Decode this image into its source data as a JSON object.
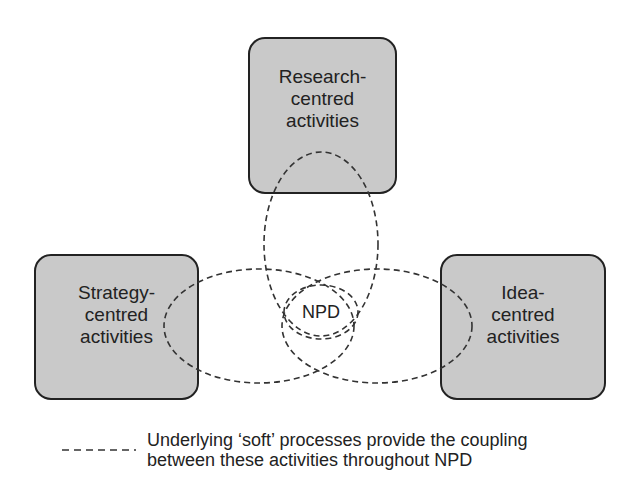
{
  "diagram": {
    "boxes": [
      {
        "id": "research",
        "label": "Research-\ncentred\nactivities"
      },
      {
        "id": "strategy",
        "label": "Strategy-\ncentred\nactivities"
      },
      {
        "id": "idea",
        "label": "Idea-\ncentred\nactivities"
      }
    ],
    "center": {
      "label": "NPD"
    },
    "legend": {
      "line_style": "dashed",
      "text": "Underlying ‘soft’ processes provide the coupling\nbetween these activities throughout NPD"
    },
    "colors": {
      "box_fill": "#c9c9c9",
      "box_border": "#222222",
      "dash_stroke": "#333333",
      "text": "#222222",
      "background": "#ffffff"
    }
  }
}
